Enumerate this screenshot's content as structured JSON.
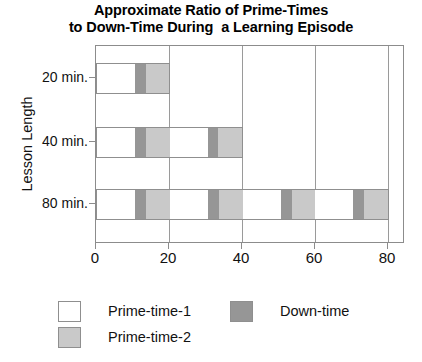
{
  "chart_data": {
    "type": "bar",
    "orientation": "horizontal",
    "stacked": true,
    "title_line1": "Approximate Ratio of Prime-Times",
    "title_line2": "to Down-Time During  a Learning Episode",
    "xlabel": "",
    "ylabel": "Lesson Length",
    "categories": [
      "20 min.",
      "40 min.",
      "80 min."
    ],
    "xlim": [
      0,
      80
    ],
    "xticks": [
      0,
      20,
      40,
      60,
      80
    ],
    "xtick_labels": [
      "0",
      "20",
      "40",
      "60",
      "80"
    ],
    "grid": true,
    "legend": {
      "position": "bottom-left",
      "entries": [
        {
          "label": "Prime-time-1",
          "color": "#ffffff",
          "key": "prime1"
        },
        {
          "label": "Down-time",
          "color": "#969696",
          "key": "down"
        },
        {
          "label": "Prime-time-2",
          "color": "#c9c9c9",
          "key": "prime2"
        }
      ]
    },
    "series": [
      {
        "name": "Prime-time-1",
        "color": "#ffffff"
      },
      {
        "name": "Down-time",
        "color": "#969696"
      },
      {
        "name": "Prime-time-2",
        "color": "#c9c9c9"
      }
    ],
    "bars": [
      {
        "category": "20 min.",
        "total": 20,
        "segments": [
          {
            "series": "Prime-time-1",
            "start": 0,
            "end": 10.5,
            "value": 10.5
          },
          {
            "series": "Down-time",
            "start": 10.5,
            "end": 13.5,
            "value": 3
          },
          {
            "series": "Prime-time-2",
            "start": 13.5,
            "end": 20,
            "value": 6.5
          }
        ]
      },
      {
        "category": "40 min.",
        "total": 40,
        "segments": [
          {
            "series": "Prime-time-1",
            "start": 0,
            "end": 10.5,
            "value": 10.5
          },
          {
            "series": "Down-time",
            "start": 10.5,
            "end": 13.5,
            "value": 3
          },
          {
            "series": "Prime-time-2",
            "start": 13.5,
            "end": 20,
            "value": 6.5
          },
          {
            "series": "Prime-time-1",
            "start": 20,
            "end": 30.5,
            "value": 10.5
          },
          {
            "series": "Down-time",
            "start": 30.5,
            "end": 33.5,
            "value": 3
          },
          {
            "series": "Prime-time-2",
            "start": 33.5,
            "end": 40,
            "value": 6.5
          }
        ]
      },
      {
        "category": "80 min.",
        "total": 80,
        "segments": [
          {
            "series": "Prime-time-1",
            "start": 0,
            "end": 10.5,
            "value": 10.5
          },
          {
            "series": "Down-time",
            "start": 10.5,
            "end": 13.5,
            "value": 3
          },
          {
            "series": "Prime-time-2",
            "start": 13.5,
            "end": 20,
            "value": 6.5
          },
          {
            "series": "Prime-time-1",
            "start": 20,
            "end": 30.5,
            "value": 10.5
          },
          {
            "series": "Down-time",
            "start": 30.5,
            "end": 33.5,
            "value": 3
          },
          {
            "series": "Prime-time-2",
            "start": 33.5,
            "end": 40,
            "value": 6.5
          },
          {
            "series": "Prime-time-1",
            "start": 40,
            "end": 50.5,
            "value": 10.5
          },
          {
            "series": "Down-time",
            "start": 50.5,
            "end": 53.5,
            "value": 3
          },
          {
            "series": "Prime-time-2",
            "start": 53.5,
            "end": 60,
            "value": 6.5
          },
          {
            "series": "Prime-time-1",
            "start": 60,
            "end": 70.5,
            "value": 10.5
          },
          {
            "series": "Down-time",
            "start": 70.5,
            "end": 73.5,
            "value": 3
          },
          {
            "series": "Prime-time-2",
            "start": 73.5,
            "end": 80,
            "value": 6.5
          }
        ]
      }
    ]
  }
}
